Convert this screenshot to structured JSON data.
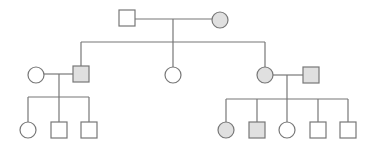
{
  "diagram": {
    "type": "pedigree",
    "colors": {
      "affected_fill": "#e0e0e0",
      "unaffected_fill": "#ffffff",
      "stroke": "#777777"
    },
    "symbol_size": 16,
    "individuals": [
      {
        "id": "I-1",
        "sex": "male",
        "affected": false,
        "cx": 127,
        "cy": 18
      },
      {
        "id": "I-2",
        "sex": "female",
        "affected": true,
        "cx": 220,
        "cy": 20
      },
      {
        "id": "II-spouse-1",
        "sex": "female",
        "affected": false,
        "cx": 36,
        "cy": 75
      },
      {
        "id": "II-1",
        "sex": "male",
        "affected": true,
        "cx": 81,
        "cy": 74
      },
      {
        "id": "II-2",
        "sex": "female",
        "affected": false,
        "cx": 173,
        "cy": 75
      },
      {
        "id": "II-3",
        "sex": "female",
        "affected": true,
        "cx": 265,
        "cy": 75
      },
      {
        "id": "II-spouse-2",
        "sex": "male",
        "affected": true,
        "cx": 311,
        "cy": 75
      },
      {
        "id": "III-1",
        "sex": "female",
        "affected": false,
        "cx": 28,
        "cy": 130
      },
      {
        "id": "III-2",
        "sex": "male",
        "affected": false,
        "cx": 59,
        "cy": 130
      },
      {
        "id": "III-3",
        "sex": "male",
        "affected": false,
        "cx": 89,
        "cy": 130
      },
      {
        "id": "III-4",
        "sex": "female",
        "affected": true,
        "cx": 226,
        "cy": 130
      },
      {
        "id": "III-5",
        "sex": "male",
        "affected": true,
        "cx": 257,
        "cy": 130
      },
      {
        "id": "III-6",
        "sex": "female",
        "affected": false,
        "cx": 287,
        "cy": 130
      },
      {
        "id": "III-7",
        "sex": "male",
        "affected": false,
        "cx": 318,
        "cy": 130
      },
      {
        "id": "III-8",
        "sex": "male",
        "affected": false,
        "cx": 348,
        "cy": 130
      }
    ],
    "lines": [
      {
        "name": "couple-I",
        "x1": 135,
        "y1": 19,
        "x2": 212,
        "y2": 19
      },
      {
        "name": "descent-I",
        "x1": 173,
        "y1": 19,
        "x2": 173,
        "y2": 42
      },
      {
        "name": "sibship-II",
        "x1": 81,
        "y1": 42,
        "x2": 265,
        "y2": 42
      },
      {
        "name": "drop-II-1",
        "x1": 81,
        "y1": 42,
        "x2": 81,
        "y2": 66
      },
      {
        "name": "drop-II-2",
        "x1": 173,
        "y1": 42,
        "x2": 173,
        "y2": 67
      },
      {
        "name": "drop-II-3",
        "x1": 265,
        "y1": 42,
        "x2": 265,
        "y2": 67
      },
      {
        "name": "couple-II-left",
        "x1": 44,
        "y1": 74,
        "x2": 73,
        "y2": 74
      },
      {
        "name": "descent-II-left",
        "x1": 59,
        "y1": 74,
        "x2": 59,
        "y2": 97
      },
      {
        "name": "sibship-III-left",
        "x1": 28,
        "y1": 97,
        "x2": 89,
        "y2": 97
      },
      {
        "name": "drop-III-1",
        "x1": 28,
        "y1": 97,
        "x2": 28,
        "y2": 122
      },
      {
        "name": "drop-III-2",
        "x1": 59,
        "y1": 97,
        "x2": 59,
        "y2": 122
      },
      {
        "name": "drop-III-3",
        "x1": 89,
        "y1": 97,
        "x2": 89,
        "y2": 122
      },
      {
        "name": "couple-II-right",
        "x1": 273,
        "y1": 75,
        "x2": 303,
        "y2": 75
      },
      {
        "name": "descent-II-right",
        "x1": 287,
        "y1": 75,
        "x2": 287,
        "y2": 99
      },
      {
        "name": "sibship-III-right",
        "x1": 226,
        "y1": 99,
        "x2": 348,
        "y2": 99
      },
      {
        "name": "drop-III-4",
        "x1": 226,
        "y1": 99,
        "x2": 226,
        "y2": 122
      },
      {
        "name": "drop-III-5",
        "x1": 257,
        "y1": 99,
        "x2": 257,
        "y2": 122
      },
      {
        "name": "drop-III-6",
        "x1": 287,
        "y1": 99,
        "x2": 287,
        "y2": 122
      },
      {
        "name": "drop-III-7",
        "x1": 318,
        "y1": 99,
        "x2": 318,
        "y2": 122
      },
      {
        "name": "drop-III-8",
        "x1": 348,
        "y1": 99,
        "x2": 348,
        "y2": 122
      }
    ]
  }
}
